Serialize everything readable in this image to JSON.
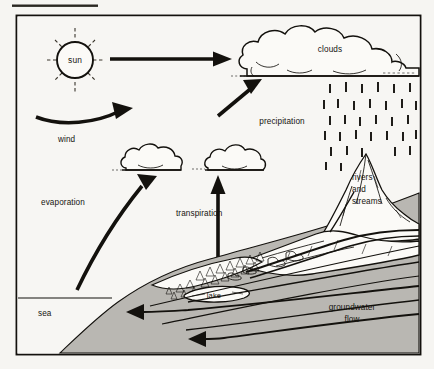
{
  "page": {
    "background_color": "#f6f5f2",
    "ink_color": "#13110d",
    "ground_color": "#b9b7b2"
  },
  "top_rule": {
    "name": "top-rule",
    "visible": true
  },
  "frame": {
    "name": "diagram-frame",
    "visible": true
  },
  "labels": {
    "sun": "sun",
    "wind": "wind",
    "clouds": "clouds",
    "precipitation": "precipitation",
    "evaporation": "evaporation",
    "transpiration": "transpiration",
    "rivers": "rivers",
    "and": "and",
    "streams": "streams",
    "lake": "lake",
    "sea": "sea",
    "groundwater": "groundwater",
    "flow": "flow"
  },
  "elements": {
    "sun_icon": "sun-icon",
    "wind_arrow": "wind-arrow",
    "top_arrow": "sun-to-clouds-arrow",
    "evaporation_arrow": "evaporation-arrow",
    "transpiration_arrow": "transpiration-arrow",
    "cloud_large": "large-cloud",
    "cloud_left": "small-cloud-left",
    "cloud_right": "small-cloud-right",
    "rain": "precipitation-rain",
    "mountains": "mountain-range",
    "forest": "conifer-forest",
    "lake_shape": "lake-water-body",
    "sea_surface": "sea-surface-line",
    "groundwater_arrows": "groundwater-flow-arrows"
  }
}
